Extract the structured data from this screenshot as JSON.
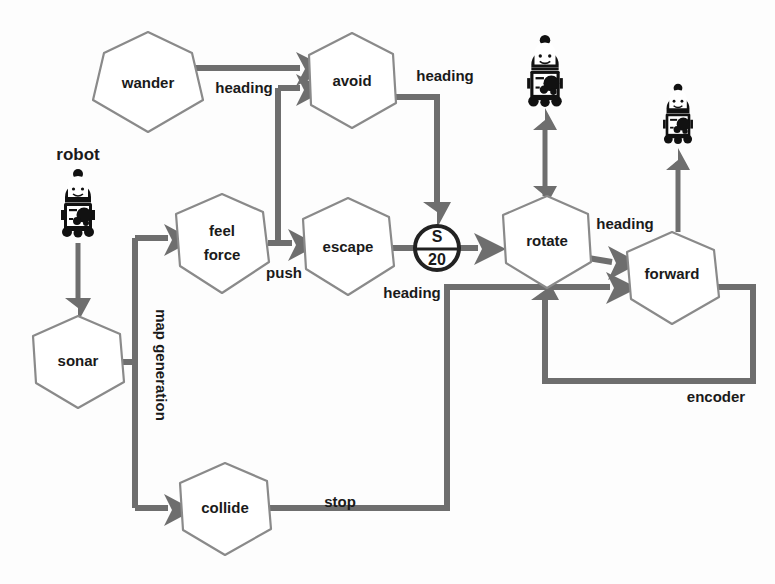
{
  "diagram": {
    "nodes": [
      {
        "id": "wander",
        "label": "wander",
        "shape": "heptagon",
        "cx": 148,
        "cy": 82
      },
      {
        "id": "avoid",
        "label": "avoid",
        "shape": "heptagon",
        "cx": 352,
        "cy": 80
      },
      {
        "id": "feelforce",
        "label": "feel force",
        "line1": "feel",
        "line2": "force",
        "shape": "heptagon",
        "cx": 222,
        "cy": 243
      },
      {
        "id": "escape",
        "label": "escape",
        "shape": "heptagon",
        "cx": 348,
        "cy": 247
      },
      {
        "id": "s20",
        "label": "S 20",
        "line1": "S",
        "line2": "20",
        "shape": "circle",
        "cx": 437,
        "cy": 248
      },
      {
        "id": "rotate",
        "label": "rotate",
        "shape": "heptagon",
        "cx": 547,
        "cy": 242
      },
      {
        "id": "forward",
        "label": "forward",
        "shape": "heptagon",
        "cx": 672,
        "cy": 277
      },
      {
        "id": "sonar",
        "label": "sonar",
        "shape": "heptagon",
        "cx": 78,
        "cy": 361
      },
      {
        "id": "collide",
        "label": "collide",
        "shape": "heptagon",
        "cx": 225,
        "cy": 508
      }
    ],
    "edge_labels": [
      {
        "id": "wander-avoid",
        "text": "heading"
      },
      {
        "id": "avoid-s20",
        "text": "heading"
      },
      {
        "id": "feelforce-escape",
        "text": "push"
      },
      {
        "id": "escape-s20",
        "text": "heading"
      },
      {
        "id": "rotate-forward",
        "text": "heading"
      },
      {
        "id": "forward-encoder",
        "text": "encoder"
      },
      {
        "id": "collide-stop",
        "text": "stop"
      },
      {
        "id": "sonar-mapgen",
        "text": "map generation"
      }
    ],
    "sensors": [
      {
        "id": "robot-sonar",
        "label": "robot",
        "cx": 78,
        "cy": 210
      },
      {
        "id": "robot-rotate",
        "label": "",
        "cx": 545,
        "cy": 78
      },
      {
        "id": "robot-forward",
        "label": "",
        "cx": 678,
        "cy": 118
      }
    ],
    "colors": {
      "node_stroke": "#8a8a8a",
      "edge": "#6e6e6e",
      "text": "#1a1a1a",
      "circle_stroke": "#222222",
      "background": "#fdfdfd"
    }
  }
}
